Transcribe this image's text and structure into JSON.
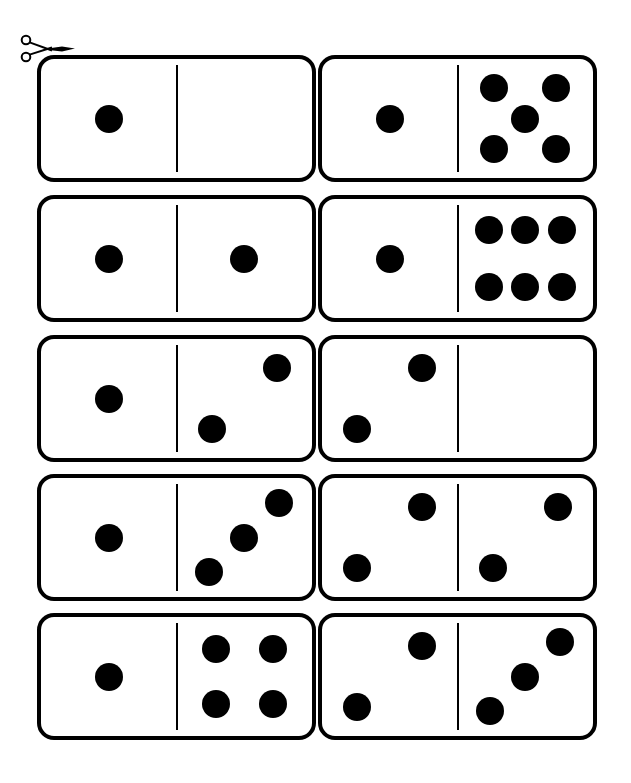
{
  "page": {
    "background_color": "#ffffff",
    "ink_color": "#000000",
    "width": 631,
    "height": 783,
    "columns": 2,
    "rows": 5,
    "tile_count": 10
  },
  "cut_marker": {
    "icon": "scissors-icon",
    "label": "cut along the line",
    "x": 18,
    "y": 33
  },
  "tile_geometry": {
    "width": 279,
    "height": 127,
    "border_width": 4,
    "corner_radius": 17,
    "pip_diameter": 28,
    "col_x": [
      37,
      318
    ],
    "row_y": [
      55,
      195,
      335,
      474,
      613
    ]
  },
  "pip_layouts": {
    "0": [],
    "1": [
      [
        50,
        50
      ]
    ],
    "2": [
      [
        26,
        76
      ],
      [
        74,
        24
      ]
    ],
    "3": [
      [
        24,
        79
      ],
      [
        50,
        50
      ],
      [
        76,
        21
      ]
    ],
    "4": [
      [
        29,
        27
      ],
      [
        71,
        27
      ],
      [
        29,
        73
      ],
      [
        71,
        73
      ]
    ],
    "5": [
      [
        27,
        24
      ],
      [
        73,
        24
      ],
      [
        50,
        50
      ],
      [
        27,
        76
      ],
      [
        73,
        76
      ]
    ],
    "6": [
      [
        23,
        26
      ],
      [
        50,
        26
      ],
      [
        77,
        26
      ],
      [
        23,
        74
      ],
      [
        50,
        74
      ],
      [
        77,
        74
      ]
    ]
  },
  "dominoes": [
    {
      "id": "domino-1-0",
      "row": 1,
      "col": 1,
      "left": 1,
      "right": 0,
      "label": "1 | 0",
      "total": 1
    },
    {
      "id": "domino-1-5",
      "row": 1,
      "col": 2,
      "left": 1,
      "right": 5,
      "label": "1 | 5",
      "total": 6
    },
    {
      "id": "domino-1-1",
      "row": 2,
      "col": 1,
      "left": 1,
      "right": 1,
      "label": "1 | 1",
      "total": 2
    },
    {
      "id": "domino-1-6",
      "row": 2,
      "col": 2,
      "left": 1,
      "right": 6,
      "label": "1 | 6",
      "total": 7
    },
    {
      "id": "domino-1-2",
      "row": 3,
      "col": 1,
      "left": 1,
      "right": 2,
      "label": "1 | 2",
      "total": 3
    },
    {
      "id": "domino-2-0",
      "row": 3,
      "col": 2,
      "left": 2,
      "right": 0,
      "label": "2 | 0",
      "total": 2
    },
    {
      "id": "domino-1-3",
      "row": 4,
      "col": 1,
      "left": 1,
      "right": 3,
      "label": "1 | 3",
      "total": 4
    },
    {
      "id": "domino-2-2",
      "row": 4,
      "col": 2,
      "left": 2,
      "right": 2,
      "label": "2 | 2",
      "total": 4
    },
    {
      "id": "domino-1-4",
      "row": 5,
      "col": 1,
      "left": 1,
      "right": 4,
      "label": "1 | 4",
      "total": 5
    },
    {
      "id": "domino-2-3",
      "row": 5,
      "col": 2,
      "left": 2,
      "right": 3,
      "label": "2 | 3",
      "total": 5
    }
  ]
}
